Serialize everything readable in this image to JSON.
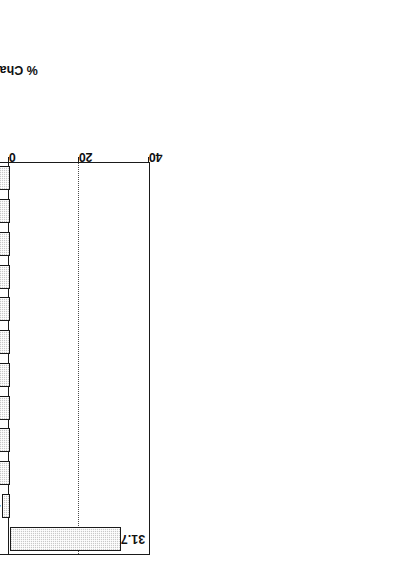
{
  "chart_data": {
    "type": "bar",
    "title": "",
    "subtitle": "",
    "xlabel": "Type of Store",
    "ylabel": "% Change 1983-1993",
    "orientation": "vertical-bars-rotated-90",
    "grid": true,
    "legend": null,
    "ylim": [
      -60,
      40
    ],
    "yticks": [
      40,
      20,
      0,
      -20,
      -40,
      -60
    ],
    "ytick_labels": [
      "40",
      "20",
      "0",
      "-20",
      "-40",
      "-60"
    ],
    "categories": [
      "Department Stores",
      "Women's Apparel",
      "Auto Parts",
      "Drug Stores",
      "Grocery Stores",
      "Jewelry Stores",
      "Shoe Stores",
      "Variety Stores",
      "Lawn & Garden",
      "Hardware Stores",
      "Misc. Apparel Stores",
      "Men's/Boy's Apparel"
    ],
    "values": [
      31.7,
      -2.5,
      -9.1,
      -10.9,
      -14.2,
      -19,
      -20.3,
      -25.8,
      -27.8,
      -30.9,
      -32,
      -44.4
    ],
    "value_labels": [
      "31.7",
      "-2.5",
      "-9.1",
      "-10.9",
      "-14.2",
      "-19",
      "-20.3",
      "-25.8",
      "-27.8",
      "-30.9",
      "-32",
      "-44.4"
    ],
    "bar_fill": "#c9c9c9",
    "bar_edge": "#1a1a1a",
    "background": "#ffffff"
  }
}
